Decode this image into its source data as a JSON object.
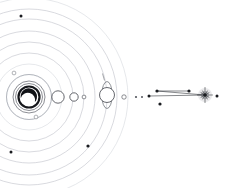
{
  "figure": {
    "title": "Planetary system schematic",
    "caption": "Concentric orbital arcs around a central star with planets and distant companion system",
    "background_color": "#ffffff",
    "width": 236,
    "height": 188
  },
  "palette": {
    "orbit_line": "#b9bcc4",
    "orbit_line_faint": "#cdd0d6",
    "star_outline": "#15171b",
    "crescent_fill": "#111317",
    "planet_outline": "#4b4e55",
    "dot_fill": "#1a1c20",
    "link_line": "#34373d",
    "burst_core": "#1a1c20"
  },
  "central_star": {
    "name": "central-star",
    "label": "Star",
    "center_x": 29,
    "center_y": 97,
    "core_radius": 10.5,
    "crescent": {
      "label": "crescent-shadow",
      "outer_radius": 8.2,
      "inner_radius": 6.4
    },
    "halo_rings": [
      {
        "label": "halo-ring-1",
        "radius": 13.5
      },
      {
        "label": "halo-ring-2",
        "radius": 16.0
      },
      {
        "label": "halo-ring-3",
        "radius": 22.5
      }
    ]
  },
  "orbits": [
    {
      "label": "orbit-1",
      "radius": 22.5,
      "tone": "faint"
    },
    {
      "label": "orbit-2",
      "radius": 33.0,
      "tone": "faint"
    },
    {
      "label": "orbit-3",
      "radius": 44.0,
      "tone": "normal"
    },
    {
      "label": "orbit-4",
      "radius": 55.0,
      "tone": "normal"
    },
    {
      "label": "orbit-5",
      "radius": 66.0,
      "tone": "normal"
    },
    {
      "label": "orbit-6",
      "radius": 78.0,
      "tone": "normal"
    },
    {
      "label": "orbit-7",
      "radius": 88.0,
      "tone": "normal"
    },
    {
      "label": "orbit-8",
      "radius": 99.0,
      "tone": "faint"
    }
  ],
  "planets": [
    {
      "name": "planet-inner-large",
      "label": "Planet A",
      "x": 58,
      "y": 97,
      "radius": 6.2,
      "has_ring": false
    },
    {
      "name": "planet-mid",
      "label": "Planet B",
      "x": 74,
      "y": 97,
      "radius": 4.2,
      "has_ring": false
    },
    {
      "name": "planet-small",
      "label": "Planet C",
      "x": 84,
      "y": 97,
      "radius": 1.9,
      "has_ring": false
    },
    {
      "name": "planet-ringed",
      "label": "Ringed planet",
      "x": 107,
      "y": 95,
      "radius": 7.5,
      "has_ring": true,
      "ring_height": 13.5,
      "ring_width": 5.2
    },
    {
      "name": "planet-outer-tiny",
      "label": "Planet D",
      "x": 124,
      "y": 97,
      "radius": 2.2,
      "has_ring": false
    }
  ],
  "orbit_markers": [
    {
      "name": "orbit-marker-north",
      "label": "Marker N",
      "x": 21,
      "y": 16,
      "radius": 1.5,
      "style": "dark"
    },
    {
      "name": "orbit-marker-upper-left",
      "label": "Marker UL",
      "x": 14,
      "y": 73,
      "radius": 1.9,
      "style": "open"
    },
    {
      "name": "orbit-marker-lower-left",
      "label": "Marker LL",
      "x": 36,
      "y": 117,
      "radius": 1.9,
      "style": "open"
    },
    {
      "name": "orbit-marker-far-left",
      "label": "Marker FL",
      "x": 11,
      "y": 152,
      "radius": 1.5,
      "style": "dark"
    },
    {
      "name": "orbit-marker-south-east",
      "label": "Marker SE",
      "x": 88,
      "y": 146,
      "radius": 1.6,
      "style": "dark"
    }
  ],
  "companion_system": {
    "name": "companion-system",
    "label": "Distant companion",
    "burst": {
      "name": "star-burst",
      "label": "Burst star",
      "x": 205,
      "y": 95,
      "core_radius": 1.8,
      "ray_count": 12,
      "ray_length": 7.5
    },
    "dots": [
      {
        "name": "companion-dot-1",
        "label": "Dot 1",
        "x": 136,
        "y": 97,
        "radius": 1.1,
        "style": "soft"
      },
      {
        "name": "companion-dot-2",
        "label": "Dot 2",
        "x": 142,
        "y": 97,
        "radius": 1.0,
        "style": "soft"
      },
      {
        "name": "companion-dot-3",
        "label": "Dot 3",
        "x": 149,
        "y": 96,
        "radius": 1.5,
        "style": "dark"
      },
      {
        "name": "companion-dot-4",
        "label": "Dot 4",
        "x": 157,
        "y": 91,
        "radius": 1.6,
        "style": "dark"
      },
      {
        "name": "companion-dot-5",
        "label": "Dot 5",
        "x": 160,
        "y": 104,
        "radius": 1.6,
        "style": "dark"
      },
      {
        "name": "companion-dot-6",
        "label": "Dot 6",
        "x": 189,
        "y": 91,
        "radius": 1.6,
        "style": "dark"
      },
      {
        "name": "companion-dot-7",
        "label": "Dot 7",
        "x": 217,
        "y": 96,
        "radius": 1.5,
        "style": "dark"
      }
    ],
    "links": [
      {
        "name": "link-upper",
        "label": "Link upper",
        "x1": 157,
        "y1": 91,
        "x2": 205,
        "y2": 95
      },
      {
        "name": "link-lower",
        "label": "Link lower",
        "x1": 149,
        "y1": 96,
        "x2": 205,
        "y2": 95
      },
      {
        "name": "link-bridge",
        "label": "Link bridge",
        "x1": 157,
        "y1": 91,
        "x2": 189,
        "y2": 91
      }
    ]
  }
}
